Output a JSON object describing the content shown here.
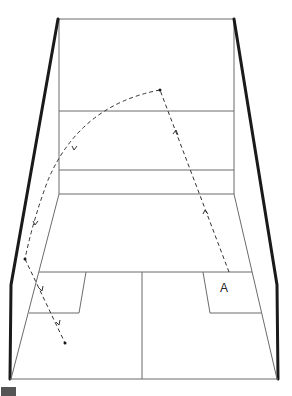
{
  "diagram": {
    "player_label": "A",
    "colors": {
      "court_lines": "#6b6b6b",
      "side_walls": "#1a1a1a",
      "trajectory": "#333333",
      "legend_marker": "#555555"
    },
    "court": {
      "front_wall": {
        "x1": 59,
        "x2": 234,
        "top": 19
      },
      "front_wall_lines_y": [
        111,
        170,
        194
      ],
      "short_line_y": 272,
      "back_line_y": 379,
      "half_court_line_x": 142
    },
    "trajectory": {
      "start": {
        "x": 229,
        "y": 272,
        "label": "A"
      },
      "front_wall_hit": {
        "x": 160,
        "y": 90
      },
      "side_wall_hit": {
        "x": 25,
        "y": 259
      },
      "end": {
        "x": 65,
        "y": 343
      },
      "direction": "A → front wall → left side wall → floor"
    }
  }
}
